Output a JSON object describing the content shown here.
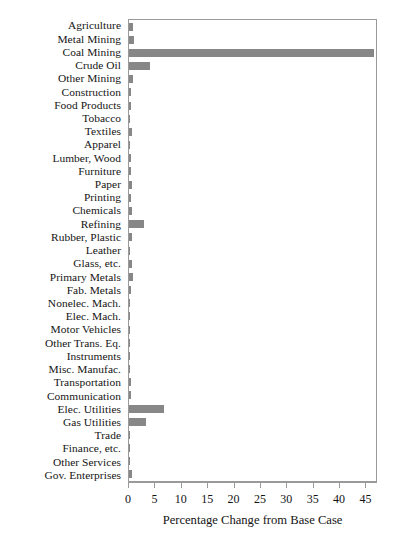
{
  "chart_data": {
    "type": "bar",
    "orientation": "horizontal",
    "title": "",
    "xlabel": "Percentage Change from Base Case",
    "ylabel": "",
    "xlim": [
      0,
      47.2
    ],
    "xticks": [
      0,
      5,
      10,
      15,
      20,
      25,
      30,
      35,
      40,
      45
    ],
    "xtick_labels": [
      "0",
      "5",
      "10",
      "15",
      "20",
      "25",
      "30",
      "35",
      "40",
      "45"
    ],
    "grid": false,
    "legend": null,
    "bar_color": "#878787",
    "frame_color": "#9a9a9a",
    "categories": [
      "Agriculture",
      "Metal Mining",
      "Coal Mining",
      "Crude Oil",
      "Other Mining",
      "Construction",
      "Food Products",
      "Tobacco",
      "Textiles",
      "Apparel",
      "Lumber, Wood",
      "Furniture",
      "Paper",
      "Printing",
      "Chemicals",
      "Refining",
      "Rubber, Plastic",
      "Leather",
      "Glass, etc.",
      "Primary Metals",
      "Fab. Metals",
      "Nonelec. Mach.",
      "Elec. Mach.",
      "Motor Vehicles",
      "Other Trans. Eq.",
      "Instruments",
      "Misc. Manufac.",
      "Transportation",
      "Communication",
      "Elec. Utilities",
      "Gas Utilities",
      "Trade",
      "Finance, etc.",
      "Other Services",
      "Gov. Enterprises"
    ],
    "values": [
      0.7,
      0.9,
      46.5,
      4.0,
      0.8,
      0.3,
      0.3,
      0.2,
      0.5,
      0.2,
      0.3,
      0.3,
      0.5,
      0.3,
      0.6,
      2.8,
      0.6,
      0.2,
      0.6,
      0.7,
      0.3,
      0.2,
      0.2,
      0.2,
      0.2,
      0.2,
      0.2,
      0.3,
      0.3,
      6.6,
      3.2,
      0.2,
      0.2,
      0.2,
      0.6
    ]
  }
}
